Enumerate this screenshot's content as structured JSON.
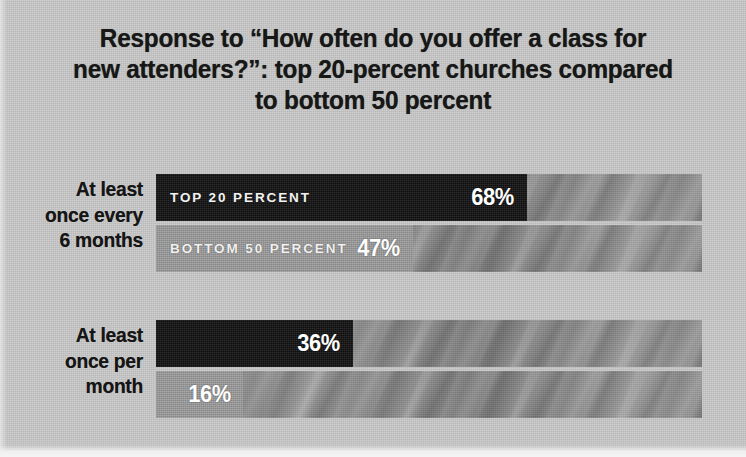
{
  "chart_data": {
    "type": "bar",
    "orientation": "horizontal",
    "title": "Response to “How often do you offer a class for new attenders?”: top 20-percent churches compared to bottom 50 percent",
    "title_lines": [
      "Response to “How often do you offer a class for",
      "new attenders?”: top 20-percent churches compared",
      "to bottom 50 percent"
    ],
    "xlabel": "",
    "ylabel": "",
    "xlim": [
      0,
      100
    ],
    "grid": false,
    "legend_position": "in-bar",
    "value_suffix": "%",
    "categories": [
      "At least once every 6 months",
      "At least once per month"
    ],
    "category_lines": [
      [
        "At least",
        "once every",
        "6 months"
      ],
      [
        "At least",
        "once per",
        "month"
      ]
    ],
    "series": [
      {
        "name": "TOP 20 PERCENT",
        "color": "#1d1d1d",
        "values": [
          68,
          36
        ],
        "value_labels": [
          "68%",
          "36%"
        ]
      },
      {
        "name": "BOTTOM 50 PERCENT",
        "color": "#9b9b9b",
        "values": [
          47,
          16
        ],
        "value_labels": [
          "47%",
          "16%"
        ]
      }
    ],
    "colors": {
      "background": "#c9c9c9",
      "track": "#8e8e8e",
      "top20": "#1d1d1d",
      "bottom50": "#9b9b9b",
      "title_text": "#171717",
      "category_text": "#151515",
      "value_text": "#ffffff"
    }
  }
}
